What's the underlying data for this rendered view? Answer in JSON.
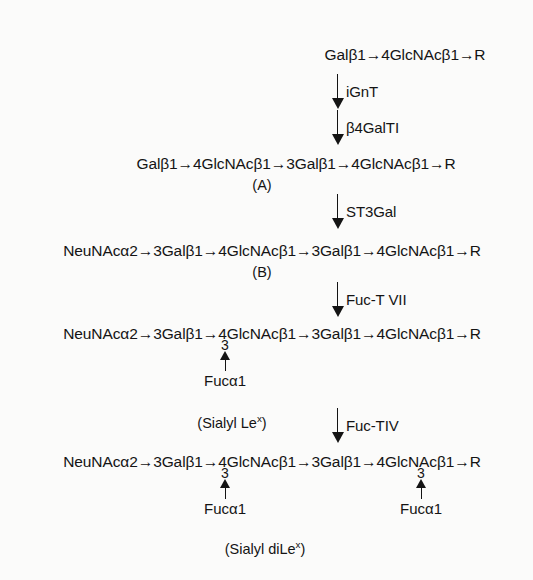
{
  "page": {
    "header_remnant": "———  ——————            ———",
    "background_color": "#fbfbfa",
    "ink_color": "#141414"
  },
  "diagram": {
    "type": "reaction-pathway",
    "formulas": [
      {
        "id": "start",
        "text": "Galβ1→4GlcNAcβ1→R"
      },
      {
        "id": "A",
        "text": "Galβ1→4GlcNAcβ1→3Galβ1→4GlcNAcβ1→R",
        "label": "(A)"
      },
      {
        "id": "B",
        "text": "NeuNAcα2→3Galβ1→4GlcNAcβ1→3Galβ1→4GlcNAcβ1→R",
        "label": "(B)"
      },
      {
        "id": "sialyl-lex",
        "text": "NeuNAcα2→3Galβ1→4GlcNAcβ1→3Galβ1→4GlcNAcβ1→R",
        "label": "(Sialyl Le",
        "label_sup": "x",
        "label_tail": ")"
      },
      {
        "id": "sialyl-dilex",
        "text": "NeuNAcα2→3Galβ1→4GlcNAcβ1→3Galβ1→4GlcNAcβ1→R",
        "label": "(Sialyl diLe",
        "label_sup": "x",
        "label_tail": ")"
      }
    ],
    "enzymes": [
      {
        "id": "ignt",
        "label": "iGnT"
      },
      {
        "id": "b4galti",
        "label": "β4GalTI"
      },
      {
        "id": "st3gal",
        "label": "ST3Gal"
      },
      {
        "id": "fuct7",
        "label": "Fuc-T VII"
      },
      {
        "id": "fuct4",
        "label": "Fuc-TIV"
      }
    ],
    "branches": [
      {
        "id": "branch-lex-1",
        "digit": "3",
        "label": "Fucα1"
      },
      {
        "id": "branch-dilex-1",
        "digit": "3",
        "label": "Fucα1"
      },
      {
        "id": "branch-dilex-2",
        "digit": "3",
        "label": "Fucα1"
      }
    ]
  }
}
